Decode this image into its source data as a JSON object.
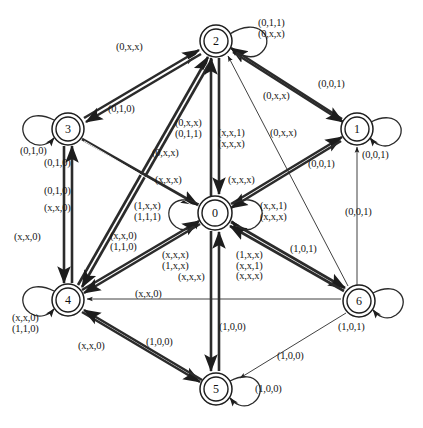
{
  "figure": {
    "type": "state-transition-diagram",
    "background_color": "#ffffff",
    "stroke_color": "#1d1d1d"
  },
  "nodes": [
    {
      "id": "0",
      "label": "0",
      "cx": 215,
      "cy": 213,
      "r_outer": 17,
      "r_inner": 13
    },
    {
      "id": "1",
      "label": "1",
      "cx": 357,
      "cy": 129,
      "r_outer": 16,
      "r_inner": 12
    },
    {
      "id": "2",
      "label": "2",
      "cx": 216,
      "cy": 41,
      "r_outer": 16,
      "r_inner": 12
    },
    {
      "id": "3",
      "label": "3",
      "cx": 68,
      "cy": 129,
      "r_outer": 16,
      "r_inner": 12
    },
    {
      "id": "4",
      "label": "4",
      "cx": 68,
      "cy": 300,
      "r_outer": 16,
      "r_inner": 12
    },
    {
      "id": "5",
      "label": "5",
      "cx": 216,
      "cy": 389,
      "r_outer": 16,
      "r_inner": 12
    },
    {
      "id": "6",
      "label": "6",
      "cx": 359,
      "cy": 301,
      "r_outer": 16,
      "r_inner": 12
    }
  ],
  "self_loops": [
    {
      "node": "2",
      "side": "right",
      "labels": [
        "(0,1,1)",
        "(0,x,x)"
      ]
    },
    {
      "node": "1",
      "side": "right",
      "labels": [
        "(0,0,1)"
      ]
    },
    {
      "node": "3",
      "side": "left",
      "labels": [
        "(0,1,0)"
      ]
    },
    {
      "node": "0",
      "side": "left",
      "labels": [
        "(1,x,x)",
        "(1,1,1)"
      ]
    },
    {
      "node": "0",
      "side": "right",
      "labels": [
        "(x,x,1)",
        "(x,x,x)"
      ]
    },
    {
      "node": "4",
      "side": "left",
      "labels": [
        "(x,x,0)",
        "(1,1,0)"
      ]
    },
    {
      "node": "6",
      "side": "right",
      "labels": [
        "(1,0,1)"
      ]
    },
    {
      "node": "5",
      "side": "right",
      "labels": [
        "(1,0,0)"
      ]
    }
  ],
  "edges": [
    {
      "from": "3",
      "to": "2",
      "labels": [
        "(0,x,x)"
      ]
    },
    {
      "from": "2",
      "to": "3",
      "labels": [
        "(0,1,0)"
      ]
    },
    {
      "from": "4",
      "to": "2",
      "labels": [
        "(0,x,x)",
        "(0,1,1)",
        "(0,x,x)"
      ]
    },
    {
      "from": "0",
      "to": "2",
      "labels": [
        "(x,x,1)",
        "(x,x,x)"
      ]
    },
    {
      "from": "2",
      "to": "0",
      "labels": [
        "(x,x,x)"
      ]
    },
    {
      "from": "6",
      "to": "2",
      "labels": [
        "(0,x,x)"
      ]
    },
    {
      "from": "1",
      "to": "2",
      "labels": [
        "(0,x,x)"
      ]
    },
    {
      "from": "2",
      "to": "1",
      "labels": [
        "(0,0,1)"
      ]
    },
    {
      "from": "0",
      "to": "1",
      "labels": [
        "(0,0,1)"
      ]
    },
    {
      "from": "6",
      "to": "1",
      "labels": [
        "(0,0,1)"
      ]
    },
    {
      "from": "3",
      "to": "4",
      "labels": [
        "(0,1,0)",
        "(x,x,0)"
      ]
    },
    {
      "from": "4",
      "to": "3",
      "labels": [
        "(0,1,0)"
      ]
    },
    {
      "from": "4",
      "to": "0",
      "labels": [
        "(x,x,0)",
        "(1,1,0)"
      ]
    },
    {
      "from": "0",
      "to": "4",
      "labels": [
        "(x,x,x)",
        "(1,x,x)",
        "(x,x,x)"
      ]
    },
    {
      "from": "0",
      "to": "6",
      "labels": [
        "(1,x,x)",
        "(x,x,1)",
        "(x,x,x)"
      ]
    },
    {
      "from": "6",
      "to": "0",
      "labels": [
        "(1,0,1)"
      ]
    },
    {
      "from": "6",
      "to": "4",
      "labels": [
        "(x,x,0)"
      ]
    },
    {
      "from": "5",
      "to": "4",
      "labels": [
        "(x,x,0)"
      ]
    },
    {
      "from": "4",
      "to": "5",
      "labels": [
        "(1,0,0)"
      ]
    },
    {
      "from": "0",
      "to": "5",
      "labels": [
        "(1,0,0)"
      ]
    },
    {
      "from": "6",
      "to": "5",
      "labels": [
        "(1,0,0)"
      ]
    },
    {
      "from": "3",
      "to": "4b",
      "labels": [
        "(x,x,0)"
      ]
    }
  ],
  "labels": [
    {
      "id": "lbl-0xx-3to2",
      "text": "(0,x,x)",
      "x": 116,
      "y": 42,
      "align": "left"
    },
    {
      "id": "lbl-loop2",
      "text": "(0,1,1)\n(0,x,x)",
      "x": 258,
      "y": 18,
      "align": "left"
    },
    {
      "id": "lbl-010-2to3",
      "text": "(0,1,0)",
      "x": 108,
      "y": 104,
      "align": "left"
    },
    {
      "id": "lbl-0xx-upper1",
      "text": "(0,x,x)",
      "x": 263,
      "y": 91,
      "align": "left"
    },
    {
      "id": "lbl-001-2to1",
      "text": "(0,0,1)",
      "x": 318,
      "y": 79,
      "align": "left"
    },
    {
      "id": "lbl-loop3",
      "text": "(0,1,0)",
      "x": 20,
      "y": 146,
      "align": "left"
    },
    {
      "id": "lbl-center-upL",
      "text": "(0,x,x)\n(0,1,1)",
      "x": 175,
      "y": 118,
      "align": "left"
    },
    {
      "id": "lbl-0xx-left2",
      "text": "(0,x,x)",
      "x": 152,
      "y": 148,
      "align": "left"
    },
    {
      "id": "lbl-center-upR",
      "text": "(x,x,1)\n(x,x,x)",
      "x": 218,
      "y": 128,
      "align": "left"
    },
    {
      "id": "lbl-0xx-right2",
      "text": "(0,x,x)",
      "x": 270,
      "y": 128,
      "align": "left"
    },
    {
      "id": "lbl-001-0to1",
      "text": "(0,0,1)",
      "x": 308,
      "y": 159,
      "align": "left"
    },
    {
      "id": "lbl-loop1",
      "text": "(0,0,1)",
      "x": 362,
      "y": 150,
      "align": "left"
    },
    {
      "id": "lbl-01o-3to4",
      "text": "(0,1,0)",
      "x": 44,
      "y": 158,
      "align": "left"
    },
    {
      "id": "lbl-01o-4to3",
      "text": "(0,1,0)",
      "x": 44,
      "y": 186,
      "align": "left"
    },
    {
      "id": "lbl-xx0-3to4b",
      "text": "(x,x,0)",
      "x": 44,
      "y": 203,
      "align": "left"
    },
    {
      "id": "lbl-xxx-left",
      "text": "(x,x,x)",
      "x": 155,
      "y": 175,
      "align": "left"
    },
    {
      "id": "lbl-xxx-right",
      "text": "(x,x,x)",
      "x": 228,
      "y": 175,
      "align": "left"
    },
    {
      "id": "lbl-001-6to1",
      "text": "(0,0,1)",
      "x": 345,
      "y": 207,
      "align": "left"
    },
    {
      "id": "lbl-xx0-vert",
      "text": "(x,x,0)",
      "x": 14,
      "y": 232,
      "align": "left"
    },
    {
      "id": "lbl-loop0-left",
      "text": "(1,x,x)\n(1,1,1)",
      "x": 134,
      "y": 201,
      "align": "left"
    },
    {
      "id": "lbl-loop0-right",
      "text": "(x,x,1)\n(x,x,x)",
      "x": 260,
      "y": 201,
      "align": "left"
    },
    {
      "id": "lbl-4to0",
      "text": "(x,x,0)\n(1,1,0)",
      "x": 110,
      "y": 231,
      "align": "left"
    },
    {
      "id": "lbl-0to4",
      "text": "(x,x,x)\n(1,x,x)",
      "x": 162,
      "y": 250,
      "align": "left"
    },
    {
      "id": "lbl-0to4b",
      "text": "(x,x,x)",
      "x": 178,
      "y": 272,
      "align": "left"
    },
    {
      "id": "lbl-0to6",
      "text": "(1,x,x)\n(x,x,1)\n(x,x,x)",
      "x": 236,
      "y": 250,
      "align": "left"
    },
    {
      "id": "lbl-101",
      "text": "(1,0,1)",
      "x": 290,
      "y": 244,
      "align": "left"
    },
    {
      "id": "lbl-xx0-6to4",
      "text": "(x,x,0)",
      "x": 135,
      "y": 289,
      "align": "left"
    },
    {
      "id": "lbl-loop4",
      "text": "(x,x,0)\n(1,1,0)",
      "x": 12,
      "y": 313,
      "align": "left"
    },
    {
      "id": "lbl-loop6",
      "text": "(1,0,1)",
      "x": 338,
      "y": 322,
      "align": "left"
    },
    {
      "id": "lbl-100-vert",
      "text": "(1,0,0)",
      "x": 219,
      "y": 322,
      "align": "left"
    },
    {
      "id": "lbl-xx0-5to4",
      "text": "(x,x,0)",
      "x": 78,
      "y": 341,
      "align": "left"
    },
    {
      "id": "lbl-100-4to5",
      "text": "(1,0,0)",
      "x": 146,
      "y": 337,
      "align": "left"
    },
    {
      "id": "lbl-100-6to5",
      "text": "(1,0,0)",
      "x": 277,
      "y": 351,
      "align": "left"
    },
    {
      "id": "lbl-loop5",
      "text": "(1,0,0)",
      "x": 255,
      "y": 384,
      "align": "left"
    }
  ]
}
